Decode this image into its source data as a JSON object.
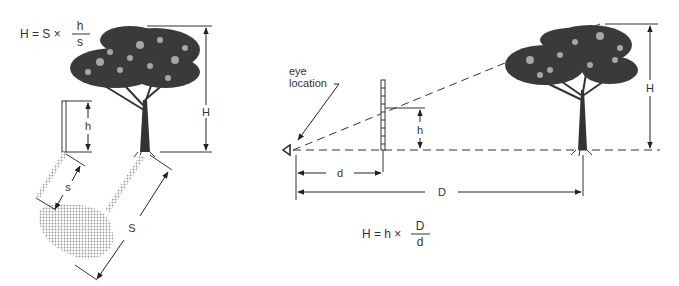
{
  "left_diagram": {
    "formula": {
      "lhs": "H = S ×",
      "numerator": "h",
      "denominator": "s"
    },
    "labels": {
      "tree_height": "H",
      "stick_height": "h",
      "stick_shadow": "s",
      "tree_shadow": "S"
    }
  },
  "right_diagram": {
    "eye_label": [
      "eye",
      "location"
    ],
    "formula": {
      "lhs": "H = h ×",
      "numerator": "D",
      "denominator": "d"
    },
    "labels": {
      "tree_height": "H",
      "stick_sight_height": "h",
      "stick_distance": "d",
      "tree_distance": "D"
    }
  },
  "colors": {
    "ink": "#222222",
    "shadow": "#bdbdbd",
    "background": "#ffffff"
  }
}
